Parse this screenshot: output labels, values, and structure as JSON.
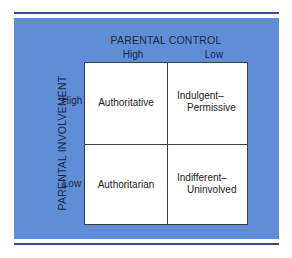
{
  "diagram": {
    "x_axis_title": "PARENTAL CONTROL",
    "x_levels": [
      "High",
      "Low"
    ],
    "y_axis_title": "PARENTAL INVOLVEMENT",
    "y_levels": [
      "High",
      "Low"
    ],
    "cells": {
      "high_involvement_high_control": "Authoritative",
      "high_involvement_low_control": {
        "line1": "Indulgent–",
        "line2": "Permissive"
      },
      "low_involvement_high_control": "Authoritarian",
      "low_involvement_low_control": {
        "line1": "Indifferent–",
        "line2": "Uninvolved"
      }
    },
    "colors": {
      "panel": "#5f8ed6",
      "rule": "#3a4f8a",
      "grid": "#ffffff",
      "text": "#1c2540"
    }
  }
}
